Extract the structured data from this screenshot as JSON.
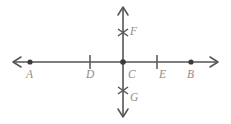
{
  "figure": {
    "kind": "geometry-number-line-diagram",
    "colors": {
      "line": "#555555",
      "dot": "#3b3b3b",
      "label": "#8d8d8d",
      "background": "#ffffff"
    },
    "horizontal_axis": {
      "name": "horizontal-line",
      "y": 62,
      "x_start": 12,
      "x_end": 219,
      "arrow_left": true,
      "arrow_right": true
    },
    "vertical_axis": {
      "name": "vertical-line",
      "x": 123,
      "y_start": 6,
      "y_end": 118,
      "arrow_up": true,
      "arrow_down": true
    },
    "points": [
      {
        "id": "A",
        "label": "A",
        "marker": "dot",
        "axis": "horizontal",
        "x": 30,
        "y": 62,
        "label_x": 26,
        "label_y": 69
      },
      {
        "id": "D",
        "label": "D",
        "marker": "tick",
        "axis": "horizontal",
        "x": 90,
        "y": 62,
        "label_x": 86,
        "label_y": 69
      },
      {
        "id": "C",
        "label": "C",
        "marker": "dot",
        "axis": "origin",
        "x": 123,
        "y": 62,
        "label_x": 128,
        "label_y": 69
      },
      {
        "id": "E",
        "label": "E",
        "marker": "tick",
        "axis": "horizontal",
        "x": 157,
        "y": 62,
        "label_x": 159,
        "label_y": 69
      },
      {
        "id": "B",
        "label": "B",
        "marker": "dot",
        "axis": "horizontal",
        "x": 191,
        "y": 62,
        "label_x": 187,
        "label_y": 69
      },
      {
        "id": "F",
        "label": "F",
        "marker": "cross-tick",
        "axis": "vertical",
        "x": 123,
        "y": 32,
        "label_x": 130,
        "label_y": 26
      },
      {
        "id": "G",
        "label": "G",
        "marker": "cross-tick",
        "axis": "vertical",
        "x": 123,
        "y": 90,
        "label_x": 130,
        "label_y": 92
      }
    ]
  }
}
